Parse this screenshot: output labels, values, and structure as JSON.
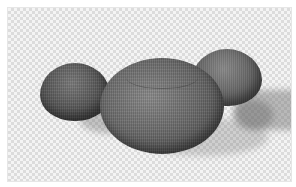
{
  "image": {
    "subject": "three woven round poufs",
    "background": "transparent-checkerboard",
    "objects": [
      {
        "name": "left-pouf",
        "tone": "#4a4a4a"
      },
      {
        "name": "center-pouf",
        "tone": "#5e5e5e"
      },
      {
        "name": "right-pouf",
        "tone": "#666666"
      }
    ]
  }
}
